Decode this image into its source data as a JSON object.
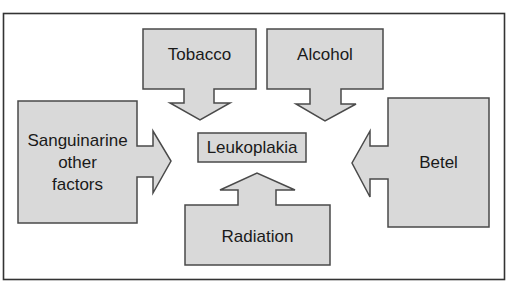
{
  "diagram": {
    "title_fragment": "Figure: Leukoplakia etiology",
    "center": {
      "label": "Leukoplakia"
    },
    "factors": [
      {
        "id": "tobacco",
        "label": "Tobacco",
        "direction": "down"
      },
      {
        "id": "alcohol",
        "label": "Alcohol",
        "direction": "down"
      },
      {
        "id": "sanguinarine",
        "label": "Sanguinarine other factors",
        "lines": [
          "Sanguinarine",
          "other",
          "factors"
        ],
        "direction": "right"
      },
      {
        "id": "betel",
        "label": "Betel",
        "direction": "left"
      },
      {
        "id": "radiation",
        "label": "Radiation",
        "direction": "up"
      }
    ],
    "colors": {
      "fill": "#d9d9d9",
      "stroke": "#4a4a4a",
      "frame": "#333333"
    }
  }
}
